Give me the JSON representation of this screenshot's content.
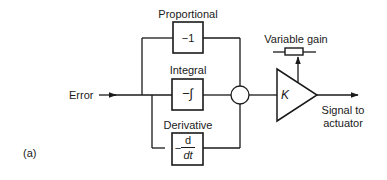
{
  "diagram": {
    "type": "block-diagram",
    "figure_label": "(a)",
    "input": {
      "label": "Error"
    },
    "blocks": [
      {
        "id": "proportional",
        "title": "Proportional",
        "content": "−1"
      },
      {
        "id": "integral",
        "title": "Integral",
        "content": "−∫"
      },
      {
        "id": "derivative",
        "title": "Derivative",
        "prefix": "−",
        "numerator": "d",
        "denominator": "dt"
      }
    ],
    "summing_junction": {
      "label": ""
    },
    "amplifier": {
      "label": "K",
      "gain_control": "Variable gain"
    },
    "output": {
      "line1": "Signal to",
      "line2": "actuator"
    },
    "colors": {
      "stroke": "#1a1a1a",
      "background": "#ffffff"
    },
    "edges": [
      {
        "from": "Error",
        "to": "proportional"
      },
      {
        "from": "Error",
        "to": "integral"
      },
      {
        "from": "Error",
        "to": "derivative"
      },
      {
        "from": "proportional",
        "to": "summing_junction"
      },
      {
        "from": "integral",
        "to": "summing_junction"
      },
      {
        "from": "derivative",
        "to": "summing_junction"
      },
      {
        "from": "summing_junction",
        "to": "amplifier"
      },
      {
        "from": "Variable gain",
        "to": "amplifier"
      },
      {
        "from": "amplifier",
        "to": "Signal to actuator"
      }
    ]
  }
}
